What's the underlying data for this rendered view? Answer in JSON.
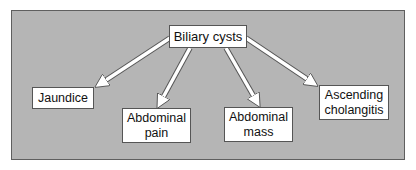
{
  "diagram": {
    "type": "flow-tree",
    "root": {
      "id": "root",
      "label": "Biliary cysts"
    },
    "children": [
      {
        "id": "jaundice",
        "label": "Jaundice"
      },
      {
        "id": "pain",
        "label": "Abdominal\npain"
      },
      {
        "id": "mass",
        "label": "Abdominal\nmass"
      },
      {
        "id": "chol",
        "label": "Ascending\ncholangitis"
      }
    ],
    "edges": [
      {
        "from": "root",
        "to": "jaundice"
      },
      {
        "from": "root",
        "to": "pain"
      },
      {
        "from": "root",
        "to": "mass"
      },
      {
        "from": "root",
        "to": "chol"
      }
    ],
    "colors": {
      "panel_background": "#b5b5b5",
      "panel_border": "#5f5f5f",
      "node_background": "#ffffff",
      "node_border": "#555555",
      "arrow_fill": "#ffffff",
      "arrow_outline": "#555555"
    }
  }
}
